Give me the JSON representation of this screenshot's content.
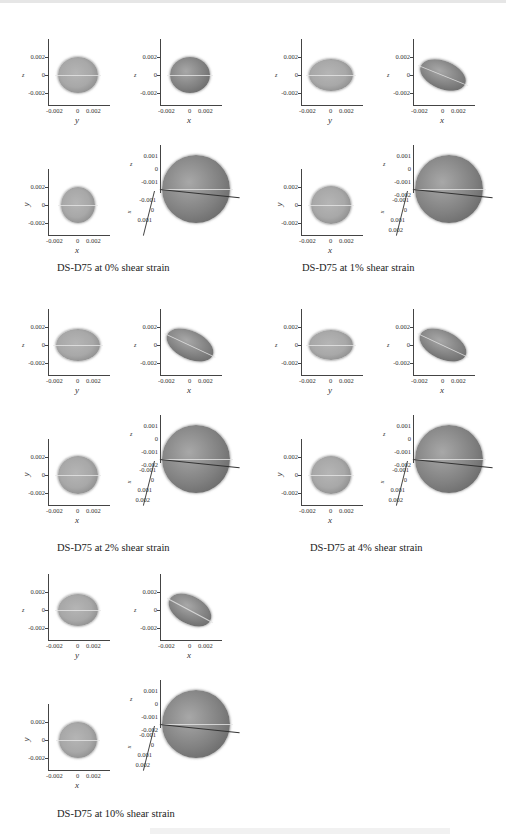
{
  "figure": {
    "panels": [
      {
        "id": "0pct",
        "caption": "DS-D75 at 0% shear strain",
        "plots": [
          {
            "view": "zy",
            "xlabel": "y",
            "ylabel": "z",
            "xticks": [
              "-0.002",
              "0",
              "0.002"
            ],
            "yticks": [
              "0.002",
              "0",
              "-0.002"
            ]
          },
          {
            "view": "zx",
            "xlabel": "x",
            "ylabel": "z",
            "xticks": [
              "-0.002",
              "0",
              "0.002"
            ],
            "yticks": [
              "0.002",
              "0",
              "-0.002"
            ]
          },
          {
            "view": "yx",
            "xlabel": "x",
            "ylabel": "y",
            "xticks": [
              "-0.002",
              "0",
              "0.002"
            ],
            "yticks": [
              "0.002",
              "0",
              "-0.002"
            ]
          },
          {
            "view": "3d",
            "zlabel": "z",
            "xlabel": "x",
            "zticks": [
              "0.001",
              "0",
              "-0.001"
            ],
            "xticks": [
              "-0.001",
              "0",
              "0.001"
            ]
          }
        ]
      },
      {
        "id": "1pct",
        "caption": "DS-D75 at 1% shear strain",
        "plots": [
          {
            "view": "zy",
            "xlabel": "y",
            "ylabel": "z",
            "xticks": [
              "-0.002",
              "0",
              "0.002"
            ],
            "yticks": [
              "0.002",
              "0",
              "-0.002"
            ]
          },
          {
            "view": "zx",
            "xlabel": "x",
            "ylabel": "z",
            "xticks": [
              "-0.002",
              "0",
              "0.002"
            ],
            "yticks": [
              "0.002",
              "0",
              "-0.002"
            ]
          },
          {
            "view": "yx",
            "xlabel": "x",
            "ylabel": "y",
            "xticks": [
              "-0.002",
              "0",
              "0.002"
            ],
            "yticks": [
              "0.002",
              "0",
              "-0.002"
            ]
          },
          {
            "view": "3d",
            "zlabel": "z",
            "xlabel": "x",
            "zticks": [
              "0.001",
              "0",
              "-0.001",
              "-0.002"
            ],
            "xticks": [
              "-0.001",
              "0",
              "0.001",
              "0.002"
            ]
          }
        ]
      },
      {
        "id": "2pct",
        "caption": "DS-D75 at 2% shear strain",
        "plots": [
          {
            "view": "zy",
            "xlabel": "y",
            "ylabel": "z",
            "xticks": [
              "-0.002",
              "0",
              "0.002"
            ],
            "yticks": [
              "0.002",
              "0",
              "-0.002"
            ]
          },
          {
            "view": "zx",
            "xlabel": "x",
            "ylabel": "z",
            "xticks": [
              "-0.002",
              "0",
              "0.002"
            ],
            "yticks": [
              "0.002",
              "0",
              "-0.002"
            ]
          },
          {
            "view": "yx",
            "xlabel": "x",
            "ylabel": "y",
            "xticks": [
              "-0.002",
              "0",
              "0.002"
            ],
            "yticks": [
              "0.002",
              "0",
              "-0.002"
            ]
          },
          {
            "view": "3d",
            "zlabel": "z",
            "xlabel": "x",
            "zticks": [
              "0.001",
              "0",
              "-0.001",
              "-0.002"
            ],
            "xticks": [
              "-0.001",
              "0",
              "0.001",
              "0.002"
            ]
          }
        ]
      },
      {
        "id": "4pct",
        "caption": "DS-D75 at 4% shear strain",
        "plots": [
          {
            "view": "zy",
            "xlabel": "y",
            "ylabel": "z",
            "xticks": [
              "-0.002",
              "0",
              "0.002"
            ],
            "yticks": [
              "0.002",
              "0",
              "-0.002"
            ]
          },
          {
            "view": "zx",
            "xlabel": "x",
            "ylabel": "z",
            "xticks": [
              "-0.002",
              "0",
              "0.002"
            ],
            "yticks": [
              "0.002",
              "0",
              "-0.002"
            ]
          },
          {
            "view": "yx",
            "xlabel": "x",
            "ylabel": "y",
            "xticks": [
              "-0.002",
              "0",
              "0.002"
            ],
            "yticks": [
              "0.002",
              "0",
              "-0.002"
            ]
          },
          {
            "view": "3d",
            "zlabel": "z",
            "xlabel": "x",
            "zticks": [
              "0.001",
              "0",
              "-0.001",
              "-0.002"
            ],
            "xticks": [
              "-0.001",
              "0",
              "0.001",
              "0.002"
            ]
          }
        ]
      },
      {
        "id": "10pct",
        "caption": "DS-D75 at 10% shear strain",
        "plots": [
          {
            "view": "zy",
            "xlabel": "y",
            "ylabel": "z",
            "xticks": [
              "-0.002",
              "0",
              "0.002"
            ],
            "yticks": [
              "0.002",
              "0",
              "-0.002"
            ]
          },
          {
            "view": "zx",
            "xlabel": "x",
            "ylabel": "z",
            "xticks": [
              "-0.002",
              "0",
              "0.002"
            ],
            "yticks": [
              "0.002",
              "0",
              "-0.002"
            ]
          },
          {
            "view": "yx",
            "xlabel": "x",
            "ylabel": "y",
            "xticks": [
              "-0.002",
              "0",
              "0.002"
            ],
            "yticks": [
              "0.002",
              "0",
              "-0.002"
            ]
          },
          {
            "view": "3d",
            "zlabel": "z",
            "xlabel": "x",
            "zticks": [
              "0.001",
              "0",
              "-0.001",
              "-0.002"
            ],
            "xticks": [
              "-0.001",
              "0",
              "0.001",
              "0.002"
            ]
          }
        ]
      }
    ],
    "colors": {
      "cluster_light": "#a8a8a8",
      "cluster_dark": "#5a5a5a",
      "axis": "#444444"
    }
  }
}
